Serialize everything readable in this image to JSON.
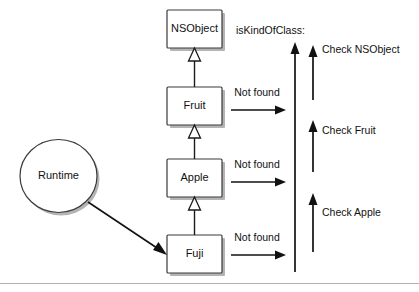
{
  "diagram": {
    "title": "isKindOfClass:",
    "runtime": {
      "label": "Runtime"
    },
    "classes": [
      {
        "id": "nsobject",
        "label": "NSObject"
      },
      {
        "id": "fruit",
        "label": "Fruit"
      },
      {
        "id": "apple",
        "label": "Apple"
      },
      {
        "id": "fuji",
        "label": "Fuji"
      }
    ],
    "not_found_labels": [
      {
        "from": "fruit",
        "label": "Not found"
      },
      {
        "from": "apple",
        "label": "Not found"
      },
      {
        "from": "fuji",
        "label": "Not found"
      }
    ],
    "checks": [
      {
        "id": "check-nsobject",
        "label": "Check NSObject"
      },
      {
        "id": "check-fruit",
        "label": "Check Fruit"
      },
      {
        "id": "check-apple",
        "label": "Check Apple"
      }
    ],
    "colors": {
      "stroke": "#1a1a1a",
      "box_border": "#3a3a3a",
      "box_fill": "#ffffff",
      "shadow": "#b4b4b4",
      "background": "#ffffff",
      "divider": "#b0b0b0"
    }
  }
}
